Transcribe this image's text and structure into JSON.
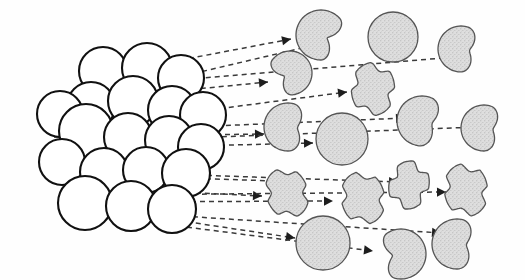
{
  "figure": {
    "title": "Cluster fragmentation and erosion along ejection trajectories",
    "background_color": "#ffffff",
    "cluster_fill": "#ffffff",
    "cluster_stroke": "#111111",
    "fragment_fill": "#d9d9d9",
    "fragment_stroke": "#555555",
    "trajectory_color": "#3a3a3a",
    "arrowhead_color": "#1d1d1d",
    "canvas": {
      "width": 525,
      "height": 280
    }
  },
  "cluster": {
    "label": "sphere-cluster",
    "sphere_count": 19,
    "radius": 24,
    "spheres": [
      {
        "id": "s1",
        "cx": 103,
        "cy": 71,
        "r": 24
      },
      {
        "id": "s2",
        "cx": 147,
        "cy": 68,
        "r": 25
      },
      {
        "id": "s3",
        "cx": 181,
        "cy": 78,
        "r": 23
      },
      {
        "id": "s4",
        "cx": 91,
        "cy": 106,
        "r": 24
      },
      {
        "id": "s5",
        "cx": 133,
        "cy": 101,
        "r": 25
      },
      {
        "id": "s6",
        "cx": 172,
        "cy": 110,
        "r": 24
      },
      {
        "id": "s7",
        "cx": 60,
        "cy": 114,
        "r": 23
      },
      {
        "id": "s8",
        "cx": 203,
        "cy": 115,
        "r": 23
      },
      {
        "id": "s9",
        "cx": 86,
        "cy": 131,
        "r": 27
      },
      {
        "id": "s10",
        "cx": 128,
        "cy": 137,
        "r": 24
      },
      {
        "id": "s11",
        "cx": 169,
        "cy": 140,
        "r": 24
      },
      {
        "id": "s12",
        "cx": 201,
        "cy": 147,
        "r": 23
      },
      {
        "id": "s13",
        "cx": 62,
        "cy": 162,
        "r": 23
      },
      {
        "id": "s14",
        "cx": 104,
        "cy": 172,
        "r": 24
      },
      {
        "id": "s15",
        "cx": 146,
        "cy": 170,
        "r": 23
      },
      {
        "id": "s16",
        "cx": 186,
        "cy": 173,
        "r": 24
      },
      {
        "id": "s17",
        "cx": 85,
        "cy": 203,
        "r": 27
      },
      {
        "id": "s18",
        "cx": 131,
        "cy": 206,
        "r": 25
      },
      {
        "id": "s19",
        "cx": 172,
        "cy": 209,
        "r": 24
      }
    ]
  },
  "fragments": [
    {
      "id": "f1",
      "name": "fragment-bitten-sphere",
      "shape": "bitten",
      "cx": 321,
      "cy": 35,
      "r": 25,
      "rot": 25,
      "bite": 0.72
    },
    {
      "id": "f2",
      "name": "fragment-full-sphere",
      "shape": "sphere",
      "cx": 393,
      "cy": 37,
      "r": 25,
      "rot": 0,
      "bite": 0
    },
    {
      "id": "f3",
      "name": "fragment-crescent",
      "shape": "crescent",
      "cx": 461,
      "cy": 49,
      "r": 23,
      "rot": 10,
      "bite": 0.62
    },
    {
      "id": "f4",
      "name": "fragment-bitten-sphere",
      "shape": "bitten",
      "cx": 290,
      "cy": 73,
      "r": 22,
      "rot": 150,
      "bite": 0.7
    },
    {
      "id": "f5",
      "name": "fragment-star-lobed",
      "shape": "lobed",
      "cx": 373,
      "cy": 89,
      "r": 24,
      "rot": 20,
      "bite": 0.55
    },
    {
      "id": "f6",
      "name": "fragment-crescent",
      "shape": "crescent",
      "cx": 288,
      "cy": 127,
      "r": 24,
      "rot": 5,
      "bite": 0.6
    },
    {
      "id": "f7",
      "name": "fragment-full-sphere",
      "shape": "sphere",
      "cx": 342,
      "cy": 139,
      "r": 26,
      "rot": 0,
      "bite": 0
    },
    {
      "id": "f8",
      "name": "fragment-crescent",
      "shape": "crescent",
      "cx": 422,
      "cy": 121,
      "r": 25,
      "rot": 15,
      "bite": 0.58
    },
    {
      "id": "f9",
      "name": "fragment-crescent",
      "shape": "crescent",
      "cx": 484,
      "cy": 128,
      "r": 23,
      "rot": 8,
      "bite": 0.6
    },
    {
      "id": "f10",
      "name": "fragment-lobed",
      "shape": "lobed",
      "cx": 287,
      "cy": 193,
      "r": 23,
      "rot": 0,
      "bite": 0.52
    },
    {
      "id": "f11",
      "name": "fragment-lobed",
      "shape": "lobed",
      "cx": 363,
      "cy": 198,
      "r": 24,
      "rot": 8,
      "bite": 0.52
    },
    {
      "id": "f12",
      "name": "fragment-star-lobed",
      "shape": "lobed",
      "cx": 409,
      "cy": 185,
      "r": 22,
      "rot": 35,
      "bite": 0.6
    },
    {
      "id": "f13",
      "name": "fragment-lobed",
      "shape": "lobed",
      "cx": 466,
      "cy": 190,
      "r": 24,
      "rot": 12,
      "bite": 0.54
    },
    {
      "id": "f14",
      "name": "fragment-full-sphere",
      "shape": "sphere",
      "cx": 323,
      "cy": 243,
      "r": 27,
      "rot": 0,
      "bite": 0
    },
    {
      "id": "f15",
      "name": "fragment-bitten-sphere",
      "shape": "bitten",
      "cx": 401,
      "cy": 254,
      "r": 25,
      "rot": 170,
      "bite": 0.65
    },
    {
      "id": "f16",
      "name": "fragment-crescent",
      "shape": "crescent",
      "cx": 457,
      "cy": 244,
      "r": 25,
      "rot": 5,
      "bite": 0.62
    }
  ],
  "trajectories": [
    {
      "id": "t1",
      "name": "trajectory-line",
      "x1": 118,
      "y1": 72,
      "x2": 291,
      "y2": 39,
      "arrow": true
    },
    {
      "id": "t2",
      "name": "trajectory-line",
      "x1": 132,
      "y1": 88,
      "x2": 302,
      "y2": 48,
      "arrow": false
    },
    {
      "id": "t3",
      "name": "trajectory-line",
      "x1": 143,
      "y1": 83,
      "x2": 455,
      "y2": 57,
      "arrow": true
    },
    {
      "id": "t4",
      "name": "trajectory-line",
      "x1": 156,
      "y1": 93,
      "x2": 268,
      "y2": 82,
      "arrow": true
    },
    {
      "id": "t5",
      "name": "trajectory-line",
      "x1": 86,
      "y1": 126,
      "x2": 347,
      "y2": 92,
      "arrow": true
    },
    {
      "id": "t6",
      "name": "trajectory-line",
      "x1": 118,
      "y1": 130,
      "x2": 405,
      "y2": 118,
      "arrow": true
    },
    {
      "id": "t7",
      "name": "trajectory-line",
      "x1": 54,
      "y1": 137,
      "x2": 264,
      "y2": 134,
      "arrow": true
    },
    {
      "id": "t8",
      "name": "trajectory-line",
      "x1": 60,
      "y1": 143,
      "x2": 478,
      "y2": 127,
      "arrow": true
    },
    {
      "id": "t9",
      "name": "trajectory-line",
      "x1": 112,
      "y1": 148,
      "x2": 313,
      "y2": 143,
      "arrow": true
    },
    {
      "id": "t10",
      "name": "trajectory-line",
      "x1": 62,
      "y1": 174,
      "x2": 275,
      "y2": 181,
      "arrow": false
    },
    {
      "id": "t11",
      "name": "trajectory-line",
      "x1": 108,
      "y1": 172,
      "x2": 398,
      "y2": 182,
      "arrow": true
    },
    {
      "id": "t12",
      "name": "trajectory-line",
      "x1": 97,
      "y1": 188,
      "x2": 262,
      "y2": 196,
      "arrow": true
    },
    {
      "id": "t13",
      "name": "trajectory-line",
      "x1": 103,
      "y1": 195,
      "x2": 446,
      "y2": 192,
      "arrow": true
    },
    {
      "id": "t14",
      "name": "trajectory-line",
      "x1": 119,
      "y1": 202,
      "x2": 333,
      "y2": 201,
      "arrow": true
    },
    {
      "id": "t15",
      "name": "trajectory-line",
      "x1": 89,
      "y1": 207,
      "x2": 295,
      "y2": 238,
      "arrow": true
    },
    {
      "id": "t16",
      "name": "trajectory-line",
      "x1": 166,
      "y1": 215,
      "x2": 441,
      "y2": 233,
      "arrow": true
    },
    {
      "id": "t17",
      "name": "trajectory-line",
      "x1": 178,
      "y1": 226,
      "x2": 373,
      "y2": 251,
      "arrow": true
    }
  ]
}
